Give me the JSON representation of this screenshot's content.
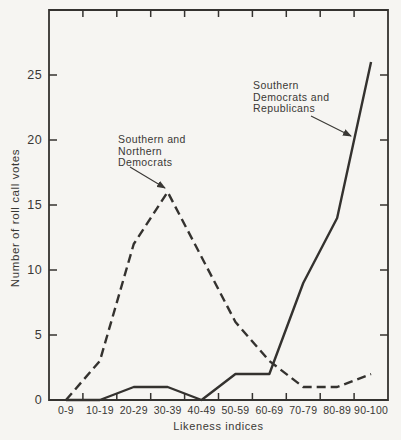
{
  "chart_data": {
    "type": "line",
    "title": "",
    "xlabel": "Likeness indices",
    "ylabel": "Number of roll call votes",
    "categories": [
      "0-9",
      "10-19",
      "20-29",
      "30-39",
      "40-49",
      "50-59",
      "60-69",
      "70-79",
      "80-89",
      "90-100"
    ],
    "yticks": [
      0,
      5,
      10,
      15,
      20,
      25
    ],
    "ylim": [
      0,
      30
    ],
    "grid": false,
    "legend_position": "none (inline arrow annotations)",
    "series": [
      {
        "name": "Southern and Northern Democrats",
        "line_style": "dashed",
        "color": "#34322f",
        "values": [
          0,
          3,
          12,
          16,
          11,
          6,
          3,
          1,
          1,
          2
        ]
      },
      {
        "name": "Southern Democrats and Republicans",
        "line_style": "solid",
        "color": "#34322f",
        "values": [
          0,
          0,
          1,
          1,
          0,
          2,
          2,
          9,
          14,
          26
        ]
      }
    ],
    "annotations": [
      {
        "lines": [
          "Southern and",
          "Northern",
          "Democrats"
        ],
        "arrow_points_to": "peak of dashed line at 30-39 (value 16)"
      },
      {
        "lines": [
          "Southern",
          "Democrats and",
          "Republicans"
        ],
        "arrow_points_to": "rising solid line between 80-89 and 90-100"
      }
    ]
  },
  "colors": {
    "ink": "#3a3835",
    "line": "#34322f",
    "paper": "#f6f5f2"
  }
}
